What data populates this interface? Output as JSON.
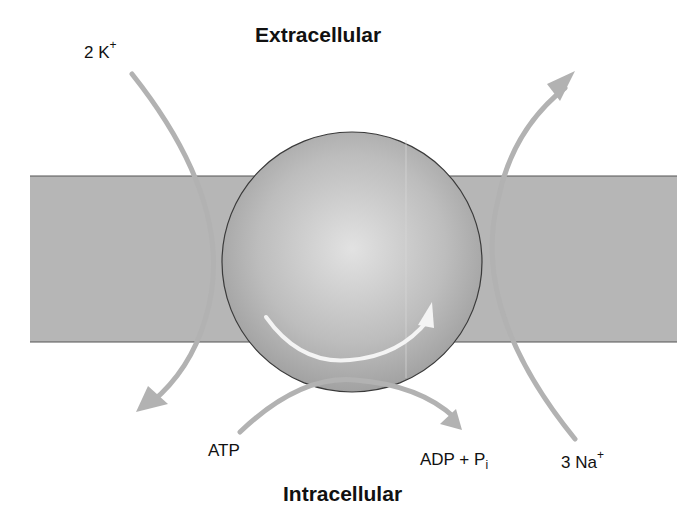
{
  "diagram": {
    "title_top": "Extracellular",
    "title_bottom": "Intracellular",
    "labels": {
      "potassium": {
        "count": "2 K",
        "charge": "+"
      },
      "sodium": {
        "count": "3 Na",
        "charge": "+"
      },
      "atp": "ATP",
      "adp": {
        "main": "ADP + P",
        "sub": "i"
      }
    },
    "colors": {
      "membrane": "#b4b4b4",
      "membrane_edge": "#555555",
      "protein_center": "#e0e0e0",
      "protein_edge": "#8e8e8e",
      "arrow": "#b2b2b2",
      "rotation_arrow": "#f4f4f4"
    }
  }
}
